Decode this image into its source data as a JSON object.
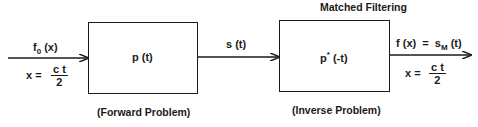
{
  "title": "Matched Filtering",
  "blocks": [
    {
      "label": "p (t)",
      "caption": "(Forward Problem)"
    },
    {
      "label_main": "p",
      "label_sup": "*",
      "label_rest": " (-t)",
      "caption": "(Inverse Problem)"
    }
  ],
  "signals": {
    "input": {
      "f": "f",
      "sub": "0",
      "arg": " (x)"
    },
    "intermediate": "s (t)",
    "output": {
      "lhs": "f (x)  =  s",
      "sub": "M",
      "rhs": " (t)"
    }
  },
  "relations": {
    "input": {
      "lhs": "x =",
      "num": "c t",
      "den": "2"
    },
    "output": {
      "lhs": "x =",
      "num": "c t",
      "den": "2"
    }
  },
  "colors": {
    "stroke": "#1a1a1a",
    "background": "#ffffff"
  }
}
